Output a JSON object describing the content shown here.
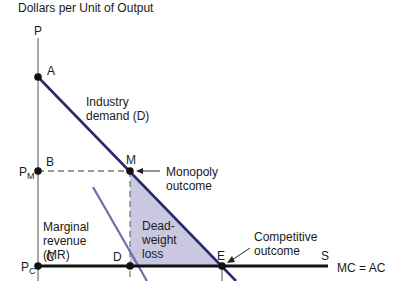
{
  "diagram": {
    "y_axis_title": "Dollars per Unit of Output",
    "y_axis_symbol": "P",
    "colors": {
      "demand_line": "#2b2a6e",
      "mr_line": "#6f6ca8",
      "deadweight_fill": "#c9c8e0",
      "mc_line": "#111111",
      "axis": "#555555",
      "point": "#111111"
    },
    "points": {
      "A": "A",
      "B": "B",
      "C": "C",
      "D": "D",
      "E": "E",
      "M": "M",
      "S": "S"
    },
    "price_labels": {
      "pm_main": "P",
      "pm_sub": "M",
      "pc_main": "P",
      "pc_sub": "C"
    },
    "curves": {
      "demand": "Industry demand (D)",
      "mr": "Marginal revenue (MR)",
      "mc": "MC = AC"
    },
    "annotations": {
      "monopoly": "Monopoly outcome",
      "competitive": "Competitive outcome",
      "deadweight": "Dead-weight loss"
    }
  }
}
